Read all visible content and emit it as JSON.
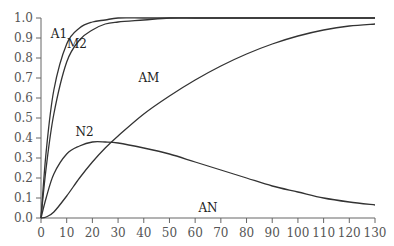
{
  "chart_data": {
    "type": "line",
    "title": "",
    "xlabel": "",
    "ylabel": "",
    "xlim": [
      0,
      130
    ],
    "ylim": [
      0,
      1.0
    ],
    "x_ticks": [
      0,
      10,
      20,
      30,
      40,
      50,
      60,
      70,
      80,
      90,
      100,
      110,
      120,
      130
    ],
    "y_ticks": [
      "0.0",
      "0.1",
      "0.2",
      "0.3",
      "0.4",
      "0.5",
      "0.6",
      "0.7",
      "0.8",
      "0.9",
      "1.0"
    ],
    "grid": false,
    "x": [
      0,
      2,
      5,
      10,
      15,
      20,
      25,
      30,
      40,
      50,
      60,
      70,
      80,
      90,
      100,
      110,
      120,
      130
    ],
    "series": [
      {
        "name": "A1",
        "values": [
          0,
          0.33,
          0.64,
          0.87,
          0.95,
          0.98,
          0.99,
          1.0,
          1.0,
          1.0,
          1.0,
          1.0,
          1.0,
          1.0,
          1.0,
          1.0,
          1.0,
          1.0
        ]
      },
      {
        "name": "M2",
        "values": [
          0,
          0.25,
          0.52,
          0.78,
          0.89,
          0.94,
          0.97,
          0.98,
          0.99,
          1.0,
          1.0,
          1.0,
          1.0,
          1.0,
          1.0,
          1.0,
          1.0,
          1.0
        ]
      },
      {
        "name": "AM",
        "values": [
          0,
          0.005,
          0.03,
          0.11,
          0.2,
          0.28,
          0.35,
          0.41,
          0.52,
          0.61,
          0.69,
          0.76,
          0.82,
          0.87,
          0.91,
          0.94,
          0.96,
          0.97
        ]
      },
      {
        "name": "N2",
        "values": [
          0,
          0.1,
          0.22,
          0.32,
          0.36,
          0.38,
          0.38,
          0.375,
          0.35,
          0.32,
          0.28,
          0.24,
          0.2,
          0.16,
          0.13,
          0.1,
          0.08,
          0.065
        ]
      }
    ],
    "annotations": [
      {
        "text": "A1",
        "x": 7,
        "y": 0.9
      },
      {
        "text": "M2",
        "x": 14,
        "y": 0.85
      },
      {
        "text": "AM",
        "x": 42,
        "y": 0.68
      },
      {
        "text": "N2",
        "x": 17,
        "y": 0.41
      },
      {
        "text": "AN",
        "x": 65,
        "y": 0.03
      }
    ]
  }
}
